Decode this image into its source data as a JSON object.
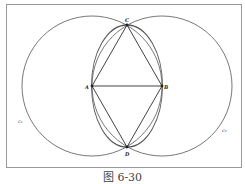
{
  "figure": {
    "caption": "图 6-30",
    "colors": {
      "stroke": "#555555",
      "frame": "#9a9a9a",
      "background": "#ffffff"
    }
  },
  "points": [
    {
      "id": "A",
      "label": "A",
      "x": 92,
      "y": 86
    },
    {
      "id": "B",
      "label": "B",
      "x": 162,
      "y": 86
    },
    {
      "id": "C",
      "label": "C",
      "x": 127,
      "y": 25
    },
    {
      "id": "D",
      "label": "D",
      "x": 127,
      "y": 147
    }
  ],
  "circles": [
    {
      "id": "c1",
      "label": "c₁",
      "center": "A",
      "radius": 70
    },
    {
      "id": "c2",
      "label": "c₂",
      "center": "B",
      "radius": 70
    },
    {
      "id": "c3",
      "label": "",
      "center": "AB-midpoint",
      "radius": 61
    }
  ],
  "segments": [
    {
      "from": "A",
      "to": "B"
    },
    {
      "from": "A",
      "to": "C"
    },
    {
      "from": "C",
      "to": "B"
    },
    {
      "from": "A",
      "to": "D"
    },
    {
      "from": "D",
      "to": "B"
    }
  ]
}
